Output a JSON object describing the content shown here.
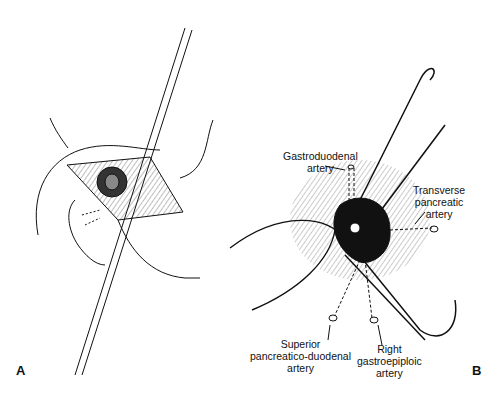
{
  "figure": {
    "panels": [
      {
        "id": "A",
        "label": "A",
        "description": "Surgical exposure of duodenal ulcer with suture passed through incision"
      },
      {
        "id": "B",
        "label": "B",
        "description": "Ligation of arteries around bleeding ulcer"
      }
    ],
    "labels": {
      "gastroduodenal": [
        "Gastroduodenal",
        "artery"
      ],
      "transverse_pancreatic": [
        "Transverse",
        "pancreatic",
        "artery"
      ],
      "superior_pancreaticoduodenal": [
        "Superior",
        "pancreatico-duodenal",
        "artery"
      ],
      "right_gastroepiploic": [
        "Right",
        "gastroepiploic",
        "artery"
      ]
    },
    "colors": {
      "line": "#111111",
      "background": "#ffffff",
      "hatch": "#555555"
    }
  }
}
